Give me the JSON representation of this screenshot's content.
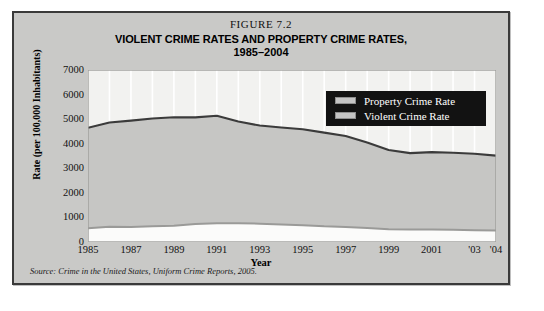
{
  "figure": {
    "number": "FIGURE 7.2",
    "title": "VIOLENT CRIME RATES AND PROPERTY CRIME RATES,",
    "subtitle": "1985–2004",
    "source": "Source: Crime in the United States, Uniform Crime Reports, 2005."
  },
  "legend": {
    "property_label": "Property Crime Rate",
    "violent_label": "Violent Crime Rate"
  },
  "colors": {
    "panel_background": "#c9c9c7",
    "panel_border": "#3a3a3a",
    "plot_background": "#f2f2f0",
    "property_fill": "#c6c6c4",
    "property_line": "#3b3b3b",
    "violent_fill": "#fbfbfa",
    "violent_line": "#9a9a98",
    "gridline": "#ffffff",
    "legend_background": "#121212",
    "legend_text": "#ffffff",
    "legend_swatch": "#c4c4c4"
  },
  "chart_data": {
    "type": "area",
    "title": "VIOLENT CRIME RATES AND PROPERTY CRIME RATES, 1985–2004",
    "xlabel": "Year",
    "ylabel": "Rate (per 100,000 Inhabitants)",
    "ylim": [
      0,
      7000
    ],
    "ytick_values": [
      7000,
      6000,
      5000,
      4000,
      3000,
      2000,
      1000,
      0
    ],
    "xlim": [
      1985,
      2004
    ],
    "xtick_values": [
      1985,
      1987,
      1989,
      1991,
      1993,
      1995,
      1997,
      1999,
      2001,
      2003,
      2004
    ],
    "xtick_labels": [
      "1985",
      "1987",
      "1989",
      "1991",
      "1993",
      "1995",
      "1997",
      "1999",
      "2001",
      "'03",
      "'04"
    ],
    "grid": "vertical",
    "legend_position": "upper-right-inside",
    "x": [
      1985,
      1986,
      1987,
      1988,
      1989,
      1990,
      1991,
      1992,
      1993,
      1994,
      1995,
      1996,
      1997,
      1998,
      1999,
      2000,
      2001,
      2002,
      2003,
      2004
    ],
    "series": [
      {
        "name": "Property Crime Rate",
        "values": [
          4650,
          4863,
          4940,
          5027,
          5078,
          5073,
          5140,
          4903,
          4740,
          4660,
          4591,
          4451,
          4316,
          4053,
          3744,
          3618,
          3658,
          3631,
          3591,
          3517
        ]
      },
      {
        "name": "Violent Crime Rate",
        "values": [
          556,
          618,
          610,
          637,
          663,
          730,
          758,
          758,
          747,
          714,
          685,
          637,
          611,
          567,
          523,
          506,
          504,
          494,
          476,
          465
        ]
      }
    ]
  }
}
